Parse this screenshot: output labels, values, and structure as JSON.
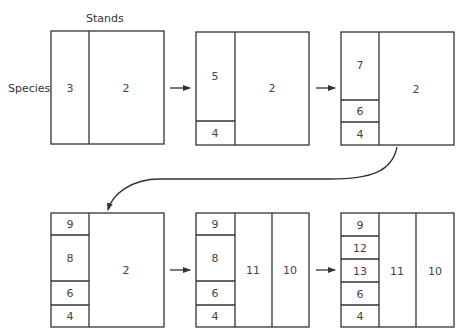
{
  "labels": {
    "stands": "Stands",
    "species": "Species"
  },
  "colors": {
    "line": "#333333",
    "text": "#444444",
    "background": "#ffffff"
  },
  "stages": [
    {
      "id": 1,
      "cells": [
        "3",
        "2"
      ]
    },
    {
      "id": 2,
      "cells": [
        "5",
        "4",
        "2"
      ]
    },
    {
      "id": 3,
      "cells": [
        "7",
        "6",
        "4",
        "2"
      ]
    },
    {
      "id": 4,
      "cells": [
        "9",
        "8",
        "6",
        "4",
        "2"
      ]
    },
    {
      "id": 5,
      "cells": [
        "9",
        "8",
        "6",
        "4",
        "11",
        "10"
      ]
    },
    {
      "id": 6,
      "cells": [
        "9",
        "12",
        "13",
        "6",
        "4",
        "11",
        "10"
      ]
    }
  ],
  "arrows": [
    {
      "from": 1,
      "to": 2,
      "icon": "right-arrow-icon"
    },
    {
      "from": 2,
      "to": 3,
      "icon": "right-arrow-icon"
    },
    {
      "from": 3,
      "to": 4,
      "icon": "curved-arrow-icon"
    },
    {
      "from": 4,
      "to": 5,
      "icon": "right-arrow-icon"
    },
    {
      "from": 5,
      "to": 6,
      "icon": "right-arrow-icon"
    }
  ]
}
